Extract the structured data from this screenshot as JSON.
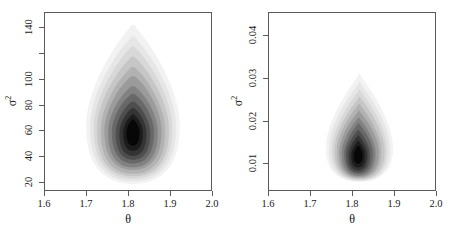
{
  "figure": {
    "background": "#ffffff",
    "ink_color": "#5a5a5a",
    "text_color": "#1a1a1a"
  },
  "chart_data": [
    {
      "type": "heatmap",
      "panel": "left",
      "title": "",
      "xlabel": "θ",
      "ylabel": "σ²",
      "ylabel_base": "σ",
      "ylabel_exponent": "2",
      "xlim": [
        1.6,
        2.0
      ],
      "ylim": [
        13,
        152
      ],
      "xticks": [
        1.6,
        1.7,
        1.8,
        1.9,
        2.0
      ],
      "xticklabels": [
        "1.6",
        "1.7",
        "1.8",
        "1.9",
        "2.0"
      ],
      "yticks": [
        20,
        40,
        60,
        80,
        100,
        120,
        140
      ],
      "yticklabels": [
        "20",
        "40",
        "60",
        "80",
        "100",
        "",
        "140"
      ],
      "grid": false,
      "legend": false,
      "colormap": "grayscale-dark-high-density",
      "description": "Bivariate posterior density contour cloud, teardrop / pear shaped, wide rounded base and narrow tapering apex pointing up.",
      "mode": {
        "x": 1.81,
        "y": 58
      },
      "mode_pixel": {
        "x": 130,
        "y": 140
      },
      "density_extent": {
        "x_min": 1.7,
        "x_max": 1.92,
        "y_min": 20,
        "y_max": 142
      },
      "contour_levels": 12,
      "contours": [
        {
          "level": 1,
          "shade": "#f2f2f2",
          "cx": 1.812,
          "cy": 64,
          "rx": 0.112,
          "ry_up": 78,
          "ry_dn": 46,
          "taper": 0.86
        },
        {
          "level": 2,
          "shade": "#e6e6e6",
          "cx": 1.812,
          "cy": 63,
          "rx": 0.103,
          "ry_up": 70,
          "ry_dn": 43,
          "taper": 0.84
        },
        {
          "level": 3,
          "shade": "#d8d8d8",
          "cx": 1.812,
          "cy": 62,
          "rx": 0.094,
          "ry_up": 63,
          "ry_dn": 40,
          "taper": 0.82
        },
        {
          "level": 4,
          "shade": "#c6c6c6",
          "cx": 1.812,
          "cy": 61,
          "rx": 0.086,
          "ry_up": 56,
          "ry_dn": 37,
          "taper": 0.8
        },
        {
          "level": 5,
          "shade": "#b2b2b2",
          "cx": 1.812,
          "cy": 60,
          "rx": 0.077,
          "ry_up": 49,
          "ry_dn": 34,
          "taper": 0.78
        },
        {
          "level": 6,
          "shade": "#9b9b9b",
          "cx": 1.812,
          "cy": 60,
          "rx": 0.068,
          "ry_up": 42,
          "ry_dn": 31,
          "taper": 0.76
        },
        {
          "level": 7,
          "shade": "#828282",
          "cx": 1.812,
          "cy": 59,
          "rx": 0.059,
          "ry_up": 35,
          "ry_dn": 28,
          "taper": 0.74
        },
        {
          "level": 8,
          "shade": "#686868",
          "cx": 1.812,
          "cy": 59,
          "rx": 0.05,
          "ry_up": 29,
          "ry_dn": 25,
          "taper": 0.73
        },
        {
          "level": 9,
          "shade": "#4e4e4e",
          "cx": 1.812,
          "cy": 58,
          "rx": 0.041,
          "ry_up": 24,
          "ry_dn": 21,
          "taper": 0.72
        },
        {
          "level": 10,
          "shade": "#343434",
          "cx": 1.812,
          "cy": 58,
          "rx": 0.032,
          "ry_up": 19,
          "ry_dn": 18,
          "taper": 0.72
        },
        {
          "level": 11,
          "shade": "#1c1c1c",
          "cx": 1.812,
          "cy": 58,
          "rx": 0.023,
          "ry_up": 14,
          "ry_dn": 14,
          "taper": 0.72
        },
        {
          "level": 12,
          "shade": "#070707",
          "cx": 1.812,
          "cy": 58,
          "rx": 0.015,
          "ry_up": 10,
          "ry_dn": 10,
          "taper": 0.72
        }
      ]
    },
    {
      "type": "heatmap",
      "panel": "right",
      "title": "",
      "xlabel": "θ",
      "ylabel": "σ²",
      "ylabel_base": "σ",
      "ylabel_exponent": "2",
      "xlim": [
        1.6,
        2.0
      ],
      "ylim": [
        0.0035,
        0.0455
      ],
      "xticks": [
        1.6,
        1.7,
        1.8,
        1.9,
        2.0
      ],
      "xticklabels": [
        "1.6",
        "1.7",
        "1.8",
        "1.9",
        "2.0"
      ],
      "yticks": [
        0.01,
        0.02,
        0.03,
        0.04
      ],
      "yticklabels": [
        "0.01",
        "0.02",
        "0.03",
        "0.04"
      ],
      "grid": false,
      "legend": false,
      "colormap": "grayscale-dark-high-density",
      "description": "Bivariate posterior density contour cloud, rounded egg / bell shape with flat wide bottom and rounded tapering top.",
      "mode": {
        "x": 1.815,
        "y": 0.0118
      },
      "mode_pixel": {
        "x": 355,
        "y": 150
      },
      "density_extent": {
        "x_min": 1.745,
        "x_max": 1.9,
        "y_min": 0.0055,
        "y_max": 0.0305
      },
      "contour_levels": 12,
      "contours": [
        {
          "level": 1,
          "shade": "#f2f2f2",
          "cx": 1.818,
          "cy": 0.0135,
          "rx": 0.08,
          "ry_up": 0.0175,
          "ry_dn": 0.008,
          "taper": 0.94
        },
        {
          "level": 2,
          "shade": "#e6e6e6",
          "cx": 1.818,
          "cy": 0.0133,
          "rx": 0.073,
          "ry_up": 0.0157,
          "ry_dn": 0.0076,
          "taper": 0.93
        },
        {
          "level": 3,
          "shade": "#d8d8d8",
          "cx": 1.818,
          "cy": 0.0131,
          "rx": 0.066,
          "ry_up": 0.0141,
          "ry_dn": 0.0072,
          "taper": 0.92
        },
        {
          "level": 4,
          "shade": "#c6c6c6",
          "cx": 1.818,
          "cy": 0.0129,
          "rx": 0.06,
          "ry_up": 0.0126,
          "ry_dn": 0.0068,
          "taper": 0.91
        },
        {
          "level": 5,
          "shade": "#b2b2b2",
          "cx": 1.817,
          "cy": 0.0127,
          "rx": 0.053,
          "ry_up": 0.0111,
          "ry_dn": 0.0063,
          "taper": 0.9
        },
        {
          "level": 6,
          "shade": "#9b9b9b",
          "cx": 1.817,
          "cy": 0.0125,
          "rx": 0.047,
          "ry_up": 0.0097,
          "ry_dn": 0.0059,
          "taper": 0.89
        },
        {
          "level": 7,
          "shade": "#828282",
          "cx": 1.816,
          "cy": 0.0123,
          "rx": 0.04,
          "ry_up": 0.0083,
          "ry_dn": 0.0054,
          "taper": 0.89
        },
        {
          "level": 8,
          "shade": "#686868",
          "cx": 1.816,
          "cy": 0.0122,
          "rx": 0.034,
          "ry_up": 0.007,
          "ry_dn": 0.0049,
          "taper": 0.88
        },
        {
          "level": 9,
          "shade": "#4e4e4e",
          "cx": 1.815,
          "cy": 0.012,
          "rx": 0.028,
          "ry_up": 0.0057,
          "ry_dn": 0.0043,
          "taper": 0.88
        },
        {
          "level": 10,
          "shade": "#343434",
          "cx": 1.815,
          "cy": 0.0119,
          "rx": 0.022,
          "ry_up": 0.0045,
          "ry_dn": 0.0037,
          "taper": 0.88
        },
        {
          "level": 11,
          "shade": "#1c1c1c",
          "cx": 1.815,
          "cy": 0.0118,
          "rx": 0.016,
          "ry_up": 0.0033,
          "ry_dn": 0.0029,
          "taper": 0.88
        },
        {
          "level": 12,
          "shade": "#070707",
          "cx": 1.815,
          "cy": 0.0118,
          "rx": 0.01,
          "ry_up": 0.0022,
          "ry_dn": 0.002,
          "taper": 0.88
        }
      ]
    }
  ]
}
